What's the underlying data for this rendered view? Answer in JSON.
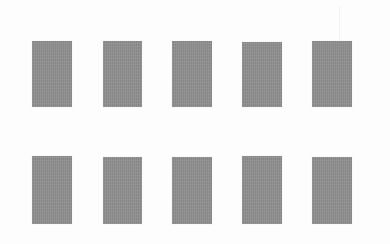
{
  "image": {
    "title": "Grid of gray rectangles",
    "width": 390,
    "height": 244,
    "background_color": "#fdfdfd",
    "rectangle_color": "#8f8f8f",
    "rows": 2,
    "columns": 5,
    "total_shapes": 10,
    "texture": "faint scanned paper grain"
  },
  "artifacts": {
    "scan_streak_label": "faint vertical scan streak"
  },
  "shapes": [
    {
      "id": "rect-r1-c1",
      "row": 1,
      "column": 1,
      "x": 32,
      "y": 41,
      "width": 40,
      "height": 66,
      "color": "#8f8f8f"
    },
    {
      "id": "rect-r1-c2",
      "row": 1,
      "column": 2,
      "x": 103,
      "y": 41,
      "width": 39,
      "height": 66,
      "color": "#8f8f8f"
    },
    {
      "id": "rect-r1-c3",
      "row": 1,
      "column": 3,
      "x": 172,
      "y": 41,
      "width": 40,
      "height": 66,
      "color": "#8f8f8f"
    },
    {
      "id": "rect-r1-c4",
      "row": 1,
      "column": 4,
      "x": 242,
      "y": 42,
      "width": 40,
      "height": 65,
      "color": "#8f8f8f"
    },
    {
      "id": "rect-r1-c5",
      "row": 1,
      "column": 5,
      "x": 312,
      "y": 41,
      "width": 40,
      "height": 66,
      "color": "#8f8f8f"
    },
    {
      "id": "rect-r2-c1",
      "row": 2,
      "column": 1,
      "x": 32,
      "y": 156,
      "width": 40,
      "height": 68,
      "color": "#8f8f8f"
    },
    {
      "id": "rect-r2-c2",
      "row": 2,
      "column": 2,
      "x": 103,
      "y": 157,
      "width": 39,
      "height": 67,
      "color": "#8f8f8f"
    },
    {
      "id": "rect-r2-c3",
      "row": 2,
      "column": 3,
      "x": 172,
      "y": 157,
      "width": 40,
      "height": 67,
      "color": "#8f8f8f"
    },
    {
      "id": "rect-r2-c4",
      "row": 2,
      "column": 4,
      "x": 242,
      "y": 156,
      "width": 40,
      "height": 68,
      "color": "#8f8f8f"
    },
    {
      "id": "rect-r2-c5",
      "row": 2,
      "column": 5,
      "x": 312,
      "y": 157,
      "width": 40,
      "height": 67,
      "color": "#8f8f8f"
    }
  ]
}
